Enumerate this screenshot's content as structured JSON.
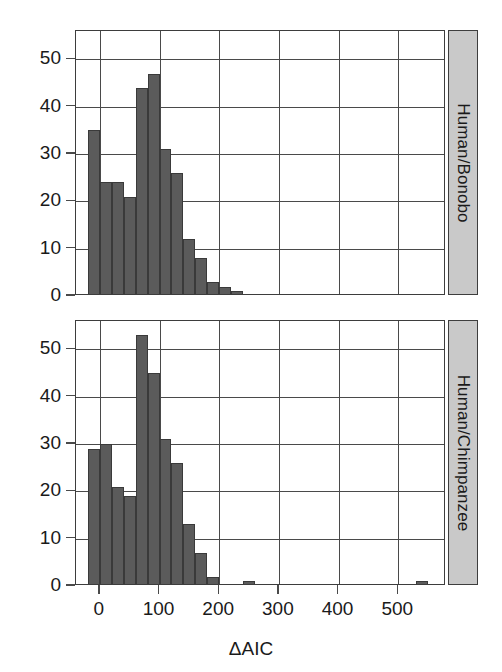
{
  "figure": {
    "xlabel": "ΔAIC",
    "strip_labels": [
      "Human/Bonobo",
      "Human/Chimpanzee"
    ],
    "xticklabels": [
      "0",
      "100",
      "200",
      "300",
      "400",
      "500"
    ],
    "yticklabels": [
      "0",
      "10",
      "20",
      "30",
      "40",
      "50"
    ],
    "colors": {
      "bar_fill": "#5b5b5b",
      "bar_stroke": "#3a3a3a",
      "frame": "#3d3d3d",
      "grid": "#4a4a4a",
      "strip_bg": "#c9c9c9",
      "text": "#1a1a1a"
    }
  },
  "chart_data": [
    {
      "type": "bar",
      "title": "Human/Bonobo",
      "xlabel": "ΔAIC",
      "ylabel": "",
      "xlim": [
        -40,
        580
      ],
      "ylim": [
        0,
        56
      ],
      "xticks": [
        0,
        100,
        200,
        300,
        400,
        500
      ],
      "yticks": [
        0,
        10,
        20,
        30,
        40,
        50
      ],
      "grid": true,
      "legend": "none",
      "bin_width": 20,
      "bin_starts": [
        -20,
        0,
        20,
        40,
        60,
        80,
        100,
        120,
        140,
        160,
        180,
        200,
        220
      ],
      "categories": [
        "-20",
        "0",
        "20",
        "40",
        "60",
        "80",
        "100",
        "120",
        "140",
        "160",
        "180",
        "200",
        "220"
      ],
      "values": [
        35,
        24,
        24,
        21,
        44,
        47,
        31,
        26,
        12,
        8,
        3,
        2,
        1
      ]
    },
    {
      "type": "bar",
      "title": "Human/Chimpanzee",
      "xlabel": "ΔAIC",
      "ylabel": "",
      "xlim": [
        -40,
        580
      ],
      "ylim": [
        0,
        56
      ],
      "xticks": [
        0,
        100,
        200,
        300,
        400,
        500
      ],
      "yticks": [
        0,
        10,
        20,
        30,
        40,
        50
      ],
      "grid": true,
      "legend": "none",
      "bin_width": 20,
      "bin_starts": [
        -20,
        0,
        20,
        40,
        60,
        80,
        100,
        120,
        140,
        160,
        180,
        240,
        530
      ],
      "categories": [
        "-20",
        "0",
        "20",
        "40",
        "60",
        "80",
        "100",
        "120",
        "140",
        "160",
        "180",
        "240",
        "530"
      ],
      "values": [
        29,
        30,
        21,
        19,
        53,
        45,
        31,
        26,
        13,
        7,
        2,
        1,
        1
      ]
    }
  ]
}
